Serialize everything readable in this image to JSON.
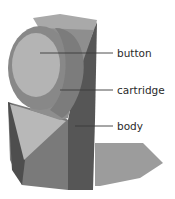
{
  "diagram": {
    "title": "",
    "labels": [
      {
        "id": "button",
        "text": "button",
        "x": 117,
        "y": 48,
        "line": {
          "x1": 40,
          "y1": 53,
          "x2": 113,
          "y2": 53
        }
      },
      {
        "id": "cartridge",
        "text": "cartridge",
        "x": 117,
        "y": 85,
        "line": {
          "x1": 60,
          "y1": 90,
          "x2": 113,
          "y2": 90
        }
      },
      {
        "id": "body",
        "text": "body",
        "x": 117,
        "y": 121,
        "line": {
          "x1": 75,
          "y1": 126,
          "x2": 113,
          "y2": 126
        }
      }
    ],
    "colors": {
      "background": "#ffffff",
      "shadow": "#9a9a9a",
      "body_dark": "#5a5a5a",
      "body_mid": "#7d7d7d",
      "body_light": "#b5b5b5",
      "cylinder_ring": "#8a8a8a",
      "button_face": "#b3b3b3",
      "top_back": "#a8a8a8",
      "leader_line": "#3a3a3a",
      "label_text": "#2a2a2a"
    }
  }
}
